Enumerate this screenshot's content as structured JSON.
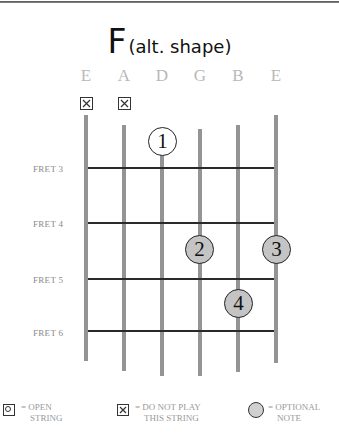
{
  "chord": {
    "name": "F",
    "variant": "(alt. shape)"
  },
  "strings": [
    {
      "name": "E",
      "x": 86,
      "top": 115,
      "bottom": 361,
      "muted": true
    },
    {
      "name": "A",
      "x": 124,
      "top": 125,
      "bottom": 371,
      "muted": true
    },
    {
      "name": "D",
      "x": 162,
      "top": 128,
      "bottom": 376,
      "muted": false
    },
    {
      "name": "G",
      "x": 200,
      "top": 129,
      "bottom": 376,
      "muted": false
    },
    {
      "name": "B",
      "x": 238,
      "top": 125,
      "bottom": 372,
      "muted": false
    },
    {
      "name": "E",
      "x": 276,
      "top": 115,
      "bottom": 363,
      "muted": false
    }
  ],
  "frets": [
    {
      "label": "FRET 3",
      "y": 167
    },
    {
      "label": "FRET 4",
      "y": 222
    },
    {
      "label": "FRET 5",
      "y": 278
    },
    {
      "label": "FRET 6",
      "y": 330
    }
  ],
  "fingers": [
    {
      "number": "1",
      "string": "D",
      "x": 162,
      "y": 141,
      "style": "white"
    },
    {
      "number": "2",
      "string": "G",
      "x": 199,
      "y": 249,
      "style": "grey"
    },
    {
      "number": "3",
      "string": "E",
      "x": 276,
      "y": 249,
      "style": "grey"
    },
    {
      "number": "4",
      "string": "B",
      "x": 238,
      "y": 303,
      "style": "grey"
    }
  ],
  "legend": {
    "open": {
      "line1": "= OPEN",
      "line2": "STRING"
    },
    "mute": {
      "line1": "= DO NOT PLAY",
      "line2": "THIS STRING"
    },
    "optional": {
      "line1": "= OPTIONAL",
      "line2": "NOTE"
    }
  },
  "colors": {
    "string": "#949494",
    "fret": "#2a2a2a",
    "finger_optional": "#c4c4c4",
    "label_grey": "#b8b8b8"
  }
}
